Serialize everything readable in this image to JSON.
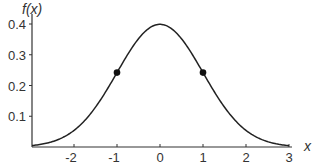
{
  "chart_data": {
    "type": "line",
    "title": "",
    "xlabel": "x",
    "ylabel": "f(x)",
    "xlim": [
      -3,
      3
    ],
    "ylim": [
      0,
      0.4
    ],
    "x_ticks": [
      -2,
      -1,
      0,
      1,
      2,
      3
    ],
    "x_tick_labels": [
      "-2",
      "-1",
      "0",
      "1",
      "2",
      "3"
    ],
    "y_ticks": [
      0.1,
      0.2,
      0.3,
      0.4
    ],
    "y_tick_labels": [
      "0.1",
      "0.2",
      "0.3",
      "0.4"
    ],
    "grid": false,
    "legend": null,
    "series": [
      {
        "name": "standard normal density",
        "x": [
          -3,
          -2.5,
          -2,
          -1.5,
          -1,
          -0.5,
          0,
          0.5,
          1,
          1.5,
          2,
          2.5,
          3
        ],
        "values": [
          0.004,
          0.018,
          0.054,
          0.13,
          0.242,
          0.352,
          0.399,
          0.352,
          0.242,
          0.13,
          0.054,
          0.018,
          0.004
        ]
      }
    ],
    "markers": [
      {
        "x": -1,
        "y": 0.242,
        "label": "inflection point"
      },
      {
        "x": 1,
        "y": 0.242,
        "label": "inflection point"
      }
    ]
  }
}
